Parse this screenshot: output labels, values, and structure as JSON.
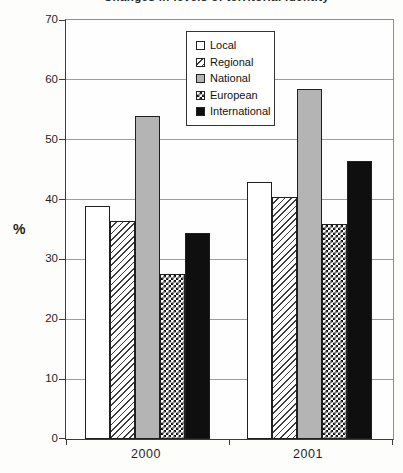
{
  "figure": {
    "title_note": "title line is clipped by the top edge of the image"
  },
  "chart_data": {
    "type": "bar",
    "title": "Changes in levels of territorial identity",
    "xlabel": "",
    "ylabel": "%",
    "ylim": [
      0,
      70
    ],
    "yticks": [
      0,
      10,
      20,
      30,
      40,
      50,
      60,
      70
    ],
    "grid": true,
    "legend_position": "inside-top-center",
    "categories": [
      "2000",
      "2001"
    ],
    "series": [
      {
        "name": "Local",
        "pattern": "white",
        "values": [
          39,
          43
        ]
      },
      {
        "name": "Regional",
        "pattern": "diagonal-hatch",
        "values": [
          36.5,
          40.5
        ]
      },
      {
        "name": "National",
        "pattern": "solid-gray",
        "values": [
          54,
          58.5
        ]
      },
      {
        "name": "European",
        "pattern": "checkerboard",
        "values": [
          27.5,
          36
        ]
      },
      {
        "name": "International",
        "pattern": "solid-black",
        "values": [
          34.5,
          46.5
        ]
      }
    ],
    "colors": {
      "gray_fill": "#b4b4b4",
      "black_fill": "#0f0f0f",
      "bar_outline": "#1f1f1f",
      "gridline": "#9e9e9e",
      "axis": "#3c3c3c",
      "background": "#fdfdfb"
    }
  }
}
